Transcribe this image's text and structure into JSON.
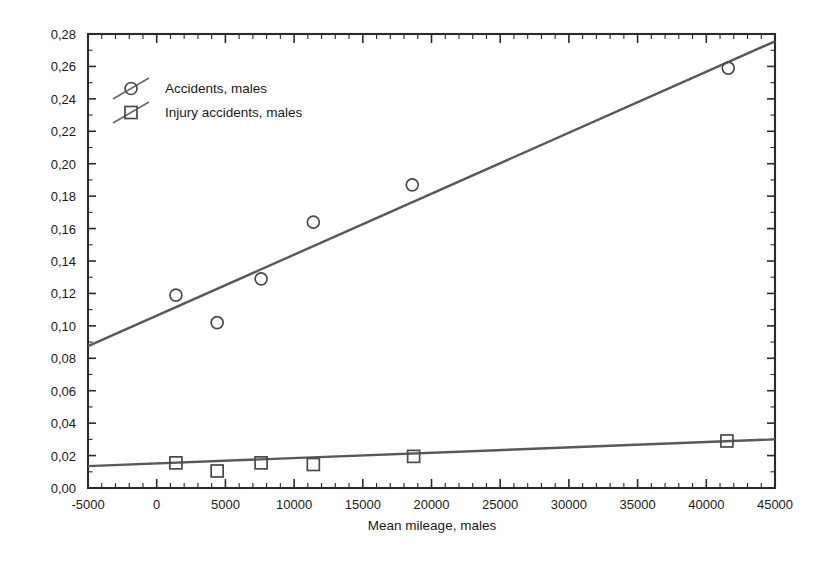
{
  "chart_data": {
    "type": "scatter",
    "title": "",
    "xlabel": "Mean mileage, males",
    "ylabel": "",
    "xlim": [
      -5000,
      45000
    ],
    "ylim": [
      0.0,
      0.28
    ],
    "grid": false,
    "legend_position": "top-left",
    "xticks": [
      "-5000",
      "0",
      "5000",
      "10000",
      "15000",
      "20000",
      "25000",
      "30000",
      "35000",
      "40000",
      "45000"
    ],
    "xtick_values": [
      -5000,
      0,
      5000,
      10000,
      15000,
      20000,
      25000,
      30000,
      35000,
      40000,
      45000
    ],
    "yticks": [
      "0,00",
      "0,02",
      "0,04",
      "0,06",
      "0,08",
      "0,10",
      "0,12",
      "0,14",
      "0,16",
      "0,18",
      "0,20",
      "0,22",
      "0,24",
      "0,26",
      "0,28"
    ],
    "ytick_values": [
      0.0,
      0.02,
      0.04,
      0.06,
      0.08,
      0.1,
      0.12,
      0.14,
      0.16,
      0.18,
      0.2,
      0.22,
      0.24,
      0.26,
      0.28
    ],
    "series": [
      {
        "name": "Accidents, males",
        "marker": "circle",
        "color": "#4a4a4a",
        "x": [
          1400,
          4400,
          7600,
          11400,
          18600,
          41600
        ],
        "y": [
          0.119,
          0.102,
          0.129,
          0.164,
          0.187,
          0.259
        ],
        "fit_line": {
          "x": [
            -5000,
            45000
          ],
          "y": [
            0.0875,
            0.2755
          ]
        }
      },
      {
        "name": "Injury accidents, males",
        "marker": "square",
        "color": "#4a4a4a",
        "x": [
          1400,
          4400,
          7600,
          11400,
          18700,
          41500
        ],
        "y": [
          0.0155,
          0.0105,
          0.0155,
          0.0145,
          0.0195,
          0.029
        ],
        "fit_line": {
          "x": [
            -5000,
            45000
          ],
          "y": [
            0.0135,
            0.03
          ]
        }
      }
    ]
  },
  "legend": {
    "entries": [
      {
        "label": "Accidents, males",
        "marker": "circle"
      },
      {
        "label": "Injury accidents, males",
        "marker": "square"
      }
    ]
  },
  "colors": {
    "axis": "#2b2b2b",
    "trend": "#595959",
    "marker": "#4a4a4a",
    "background": "#ffffff",
    "text": "#1a1a1a"
  }
}
